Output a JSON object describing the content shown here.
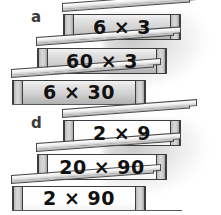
{
  "page": {
    "background_color": "#ffffff",
    "width": 221,
    "height": 215
  },
  "figures": [
    {
      "letter": "a",
      "face_style": "gray",
      "steps": [
        {
          "position": "top",
          "expression": "6 × 3"
        },
        {
          "position": "middle",
          "expression": "60 × 3"
        },
        {
          "position": "bottom",
          "expression": "6 × 30"
        }
      ]
    },
    {
      "letter": "d",
      "face_style": "white",
      "steps": [
        {
          "position": "top",
          "expression": "2 × 9"
        },
        {
          "position": "middle",
          "expression": "20 × 90"
        },
        {
          "position": "bottom",
          "expression": "2 × 90"
        }
      ]
    }
  ],
  "colors": {
    "outline": "#3d3d3d",
    "face_gray_light": "#f4f4f4",
    "face_gray_dark": "#b2b2b2",
    "face_white": "#ffffff",
    "side_panel": "#c9c9c9",
    "text": "#111111",
    "letter_label": "#3b3b3b",
    "ground_line": "#5a5a5a",
    "shadow": "#989898"
  }
}
